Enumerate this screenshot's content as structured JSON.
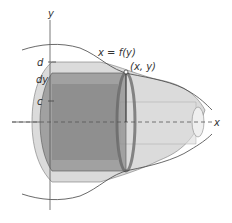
{
  "diagram": {
    "type": "solid-of-revolution-shell",
    "labels": {
      "y_axis": "y",
      "x_axis": "x",
      "curve": "x = f(y)",
      "point": "(x, y)",
      "d": "d",
      "dy": "dy",
      "c": "c"
    },
    "colors": {
      "solid_outer": "#c8c8c8",
      "shell": "#8a8a8a",
      "curve": "#444444",
      "axis": "#555555",
      "point": "#ffffff"
    }
  }
}
